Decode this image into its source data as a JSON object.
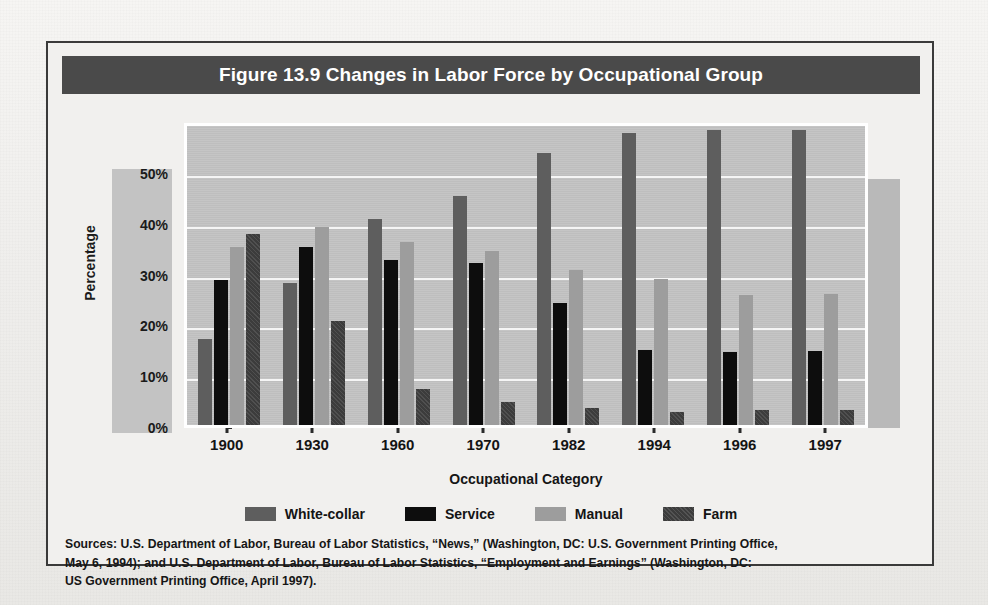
{
  "figure": {
    "title": "Figure 13.9  Changes in Labor Force by Occupational Group",
    "colors": {
      "title_bar": "#4a4a4a",
      "plot_bg": "#c2c2c2",
      "gridline": "#f5f5f5",
      "frame_border": "#3a3a3a",
      "white_collar": "#5e5e5e",
      "service": "#0d0d0d",
      "manual": "#9d9d9d",
      "farm": "#3c3c3c"
    }
  },
  "chart_data": {
    "type": "bar",
    "title": "Figure 13.9  Changes in Labor Force by Occupational Group",
    "xlabel": "Occupational Category",
    "ylabel": "Percentage",
    "categories": [
      "1900",
      "1930",
      "1960",
      "1970",
      "1982",
      "1994",
      "1996",
      "1997"
    ],
    "series": [
      {
        "name": "White-collar",
        "color": "#5e5e5e",
        "values": [
          17.0,
          28.0,
          40.5,
          45.0,
          53.5,
          57.5,
          58.0,
          58.0
        ]
      },
      {
        "name": "Service",
        "color": "#0d0d0d",
        "values": [
          28.5,
          35.0,
          32.5,
          31.8,
          24.0,
          14.8,
          14.3,
          14.5
        ]
      },
      {
        "name": "Manual",
        "color": "#9d9d9d",
        "values": [
          35.0,
          39.0,
          36.0,
          34.2,
          30.5,
          28.8,
          25.5,
          25.8
        ]
      },
      {
        "name": "Farm",
        "color": "#3c3c3c",
        "values": [
          37.5,
          20.5,
          7.0,
          4.6,
          3.4,
          2.6,
          3.0,
          3.0
        ]
      }
    ],
    "ylim": [
      0,
      60
    ],
    "yticks": [
      0,
      10,
      20,
      30,
      40,
      50
    ],
    "ytick_labels": [
      "0%",
      "10%",
      "20%",
      "30%",
      "40%",
      "50%"
    ],
    "grid": true,
    "legend_position": "bottom"
  },
  "legend": {
    "items": [
      {
        "label": "White-collar"
      },
      {
        "label": "Service"
      },
      {
        "label": "Manual"
      },
      {
        "label": "Farm"
      }
    ]
  },
  "sources": {
    "line1": "Sources: U.S. Department of Labor, Bureau of Labor Statistics, “News,” (Washington, DC: U.S. Government Printing Office,",
    "line2": "May 6, 1994); and U.S. Department of Labor, Bureau of Labor Statistics, “Employment and Earnings” (Washington, DC:",
    "line3": "US Government Printing Office, April 1997)."
  }
}
